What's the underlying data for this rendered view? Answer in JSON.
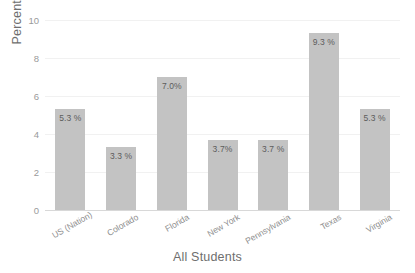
{
  "chart_data": {
    "type": "bar",
    "title": "",
    "subtitle": "",
    "xlabel": "All Students",
    "ylabel": "Percentage",
    "categories": [
      "US (Nation)",
      "Colorado",
      "Florida",
      "New York",
      "Pennsylvania",
      "Texas",
      "Virginia"
    ],
    "values": [
      5.3,
      3.3,
      7.0,
      3.7,
      3.7,
      9.3,
      5.3
    ],
    "data_labels": [
      "5.3 %",
      "3.3 %",
      "7.0%",
      "3.7%",
      "3.7 %",
      "9.3 %",
      "5.3 %"
    ],
    "ylim": [
      0,
      10
    ],
    "yticks": [
      0,
      2,
      4,
      6,
      8,
      10
    ],
    "ytick_labels": [
      "0",
      "2",
      "4",
      "6",
      "8",
      "10"
    ],
    "grid": true,
    "legend": "none",
    "bar_color": "#c3c3c3",
    "gridline_color": "#f1f1f1",
    "axis_color": "#d8d8d8",
    "label_color": "#8e8e8e",
    "background": "#ffffff"
  }
}
